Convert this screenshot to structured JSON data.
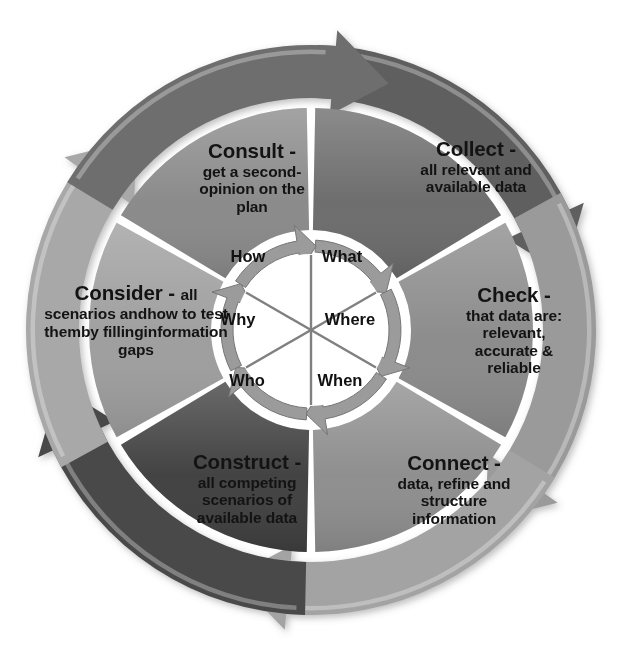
{
  "diagram": {
    "background_color": "#ffffff",
    "center": {
      "x": 311,
      "y": 330
    },
    "radii": {
      "hub_inner": 72,
      "hub_arrow_ring": 96,
      "wedge_inner": 100,
      "wedge_outer": 222,
      "arc_inner": 232,
      "arc_outer": 285
    },
    "segments": [
      {
        "id": "collect",
        "head": "Collect -",
        "body": [
          "all relevant and",
          "available data"
        ],
        "wedge_color": "#6b6b6b",
        "arc_color": "#5e5e5e",
        "start_angle": -90,
        "end_angle": -30,
        "label_x": 386,
        "label_y": 138,
        "label_width": 180,
        "head_inline": false
      },
      {
        "id": "check",
        "head": "Check -",
        "body": [
          "that data are:",
          "relevant,",
          "accurate &",
          "reliable"
        ],
        "wedge_color": "#8a8a8a",
        "arc_color": "#9a9a9a",
        "start_angle": -30,
        "end_angle": 30,
        "label_x": 432,
        "label_y": 284,
        "label_width": 164,
        "head_inline": false
      },
      {
        "id": "connect",
        "head": "Connect -",
        "body": [
          "data, refine and",
          "structure",
          "information"
        ],
        "wedge_color": "#8d8d8d",
        "arc_color": "#a3a3a3",
        "start_angle": 30,
        "end_angle": 90,
        "label_x": 362,
        "label_y": 452,
        "label_width": 184,
        "head_inline": false
      },
      {
        "id": "construct",
        "head": "Construct -",
        "body": [
          "all competing",
          "scenarios of",
          "available data"
        ],
        "wedge_color": "#3f3f3f",
        "arc_color": "#4a4a4a",
        "start_angle": 90,
        "end_angle": 150,
        "label_x": 152,
        "label_y": 451,
        "label_width": 190,
        "head_inline": false
      },
      {
        "id": "consider",
        "head": "Consider -",
        "body": [
          "all",
          "scenarios and",
          "how to test them",
          "by filling",
          "information gaps"
        ],
        "wedge_color": "#9d9d9d",
        "arc_color": "#a8a8a8",
        "start_angle": 150,
        "end_angle": 210,
        "label_x": 36,
        "label_y": 282,
        "label_width": 200,
        "head_inline": true
      },
      {
        "id": "consult",
        "head": "Consult -",
        "body": [
          "get a second-",
          "opinion on the",
          "plan"
        ],
        "wedge_color": "#898989",
        "arc_color": "#6e6e6e",
        "start_angle": 210,
        "end_angle": 270,
        "label_x": 162,
        "label_y": 140,
        "label_width": 180,
        "head_inline": false
      }
    ],
    "hub": {
      "fill_color": "#ffffff",
      "divider_color": "#808080",
      "ring_color": "#9b9b9b",
      "words": [
        {
          "id": "what",
          "text": "What",
          "x": 342,
          "y": 257
        },
        {
          "id": "where",
          "text": "Where",
          "x": 350,
          "y": 320
        },
        {
          "id": "when",
          "text": "When",
          "x": 340,
          "y": 381
        },
        {
          "id": "who",
          "text": "Who",
          "x": 247,
          "y": 381
        },
        {
          "id": "why",
          "text": "Why",
          "x": 238,
          "y": 320
        },
        {
          "id": "how",
          "text": "How",
          "x": 248,
          "y": 257
        }
      ]
    }
  }
}
